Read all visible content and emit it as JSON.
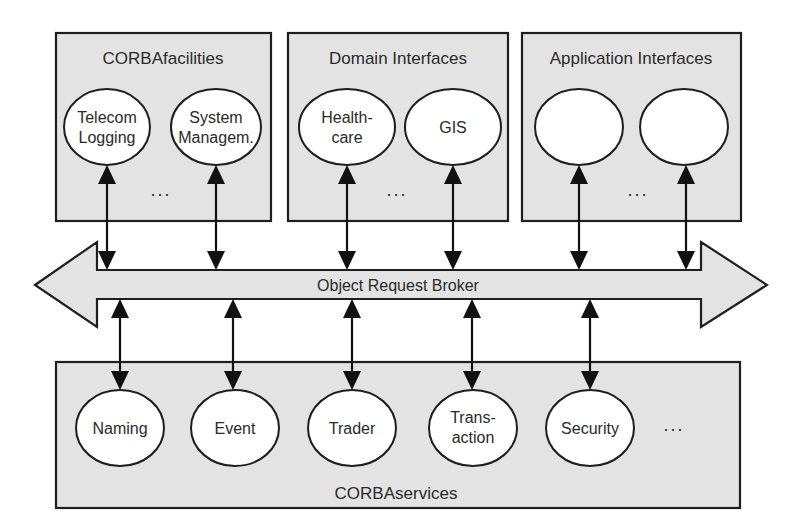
{
  "diagram": {
    "colors": {
      "box_fill": "#e3e3e3",
      "stroke": "#1e1e1e",
      "node_fill": "#ffffff",
      "text": "#2a2a2a"
    },
    "top_groups": [
      {
        "title": "CORBAfacilities",
        "nodes": [
          {
            "line1": "Telecom",
            "line2": "Logging"
          },
          {
            "line1": "System",
            "line2": "Managem."
          }
        ],
        "ellipsis": "..."
      },
      {
        "title": "Domain Interfaces",
        "nodes": [
          {
            "line1": "Health-",
            "line2": "care"
          },
          {
            "line1": "GIS",
            "line2": ""
          }
        ],
        "ellipsis": "..."
      },
      {
        "title": "Application Interfaces",
        "nodes": [
          {
            "line1": "",
            "line2": ""
          },
          {
            "line1": "",
            "line2": ""
          }
        ],
        "ellipsis": "..."
      }
    ],
    "bus": {
      "label": "Object Request Broker"
    },
    "bottom_group": {
      "title": "CORBAservices",
      "nodes": [
        {
          "line1": "Naming",
          "line2": ""
        },
        {
          "line1": "Event",
          "line2": ""
        },
        {
          "line1": "Trader",
          "line2": ""
        },
        {
          "line1": "Trans-",
          "line2": "action"
        },
        {
          "line1": "Security",
          "line2": ""
        }
      ],
      "ellipsis": "..."
    }
  }
}
